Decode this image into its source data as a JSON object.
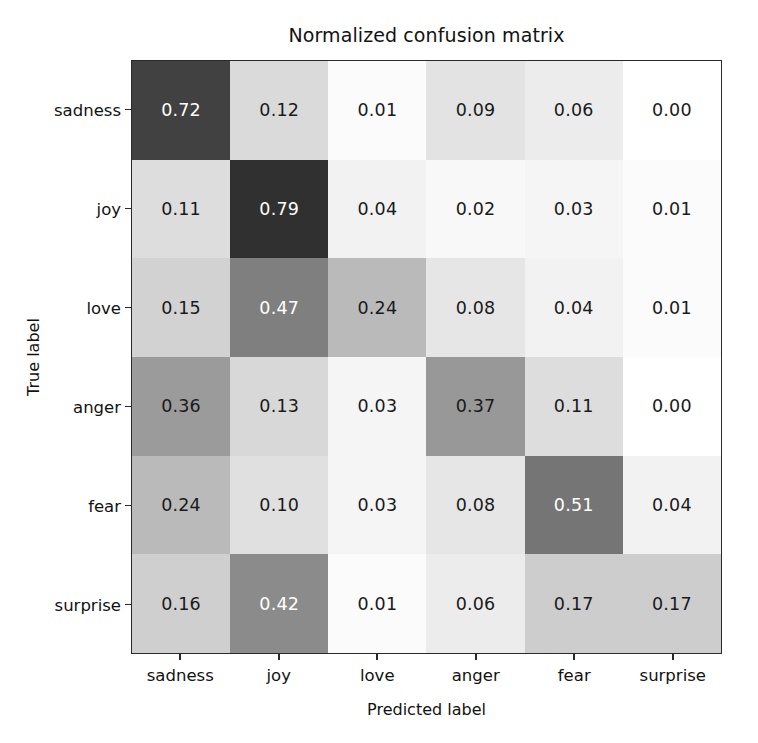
{
  "chart_data": {
    "type": "heatmap",
    "title": "Normalized confusion matrix",
    "xlabel": "Predicted label",
    "ylabel": "True label",
    "x_categories": [
      "sadness",
      "joy",
      "love",
      "anger",
      "fear",
      "surprise"
    ],
    "y_categories": [
      "sadness",
      "joy",
      "love",
      "anger",
      "fear",
      "surprise"
    ],
    "grid": false,
    "legend": "none",
    "colormap": "grays-inverted",
    "zlim": [
      0.0,
      0.79
    ],
    "cell_text_light_threshold": 0.4,
    "rows": [
      {
        "label": "sadness",
        "values": [
          0.72,
          0.12,
          0.01,
          0.09,
          0.06,
          0.0
        ],
        "display": [
          "0.72",
          "0.12",
          "0.01",
          "0.09",
          "0.06",
          "0.00"
        ]
      },
      {
        "label": "joy",
        "values": [
          0.11,
          0.79,
          0.04,
          0.02,
          0.03,
          0.01
        ],
        "display": [
          "0.11",
          "0.79",
          "0.04",
          "0.02",
          "0.03",
          "0.01"
        ]
      },
      {
        "label": "love",
        "values": [
          0.15,
          0.47,
          0.24,
          0.08,
          0.04,
          0.01
        ],
        "display": [
          "0.15",
          "0.47",
          "0.24",
          "0.08",
          "0.04",
          "0.01"
        ]
      },
      {
        "label": "anger",
        "values": [
          0.36,
          0.13,
          0.03,
          0.37,
          0.11,
          0.0
        ],
        "display": [
          "0.36",
          "0.13",
          "0.03",
          "0.37",
          "0.11",
          "0.00"
        ]
      },
      {
        "label": "fear",
        "values": [
          0.24,
          0.1,
          0.03,
          0.08,
          0.51,
          0.04
        ],
        "display": [
          "0.24",
          "0.10",
          "0.03",
          "0.08",
          "0.51",
          "0.04"
        ]
      },
      {
        "label": "surprise",
        "values": [
          0.16,
          0.42,
          0.01,
          0.06,
          0.17,
          0.17
        ],
        "display": [
          "0.16",
          "0.42",
          "0.01",
          "0.06",
          "0.17",
          "0.17"
        ]
      }
    ],
    "colors": {
      "background": "#ffffff",
      "axis": "#2a2a2a",
      "text": "#121212",
      "cell_text_dark": "#1a1a1a",
      "cell_text_light": "#ffffff",
      "cmap_low": "#ffffff",
      "cmap_high": "#303030"
    }
  }
}
